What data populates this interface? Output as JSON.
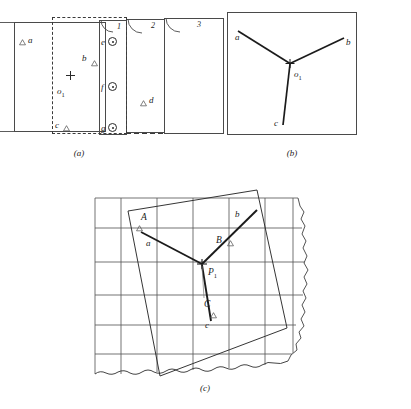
{
  "figure": {
    "domain_note": "photogrammetry figure: overlapping aerial photographs, graphical template, and map fitting",
    "captions": [
      {
        "id": "cap-a",
        "text": "(a)"
      },
      {
        "id": "cap-b",
        "text": "(b)"
      },
      {
        "id": "cap-c",
        "text": "(c)"
      }
    ]
  },
  "panel_a": {
    "caption": "(a)",
    "photo_numbers": [
      "1",
      "2",
      "3"
    ],
    "control_points": [
      {
        "label": "a",
        "marker": "triangle"
      },
      {
        "label": "b",
        "marker": "triangle"
      },
      {
        "label": "c",
        "marker": "triangle"
      },
      {
        "label": "d",
        "marker": "triangle"
      }
    ],
    "pass_points": [
      {
        "label": "e",
        "marker": "circle-dot"
      },
      {
        "label": "f",
        "marker": "circle-dot"
      },
      {
        "label": "g",
        "marker": "circle-dot"
      }
    ],
    "principal_point": {
      "label": "o",
      "subscript": "1",
      "marker": "plus"
    }
  },
  "panel_b": {
    "caption": "(b)",
    "center_label": {
      "label": "o",
      "subscript": "1",
      "marker": "plus"
    },
    "rays": [
      {
        "label": "a",
        "direction": "upper-left"
      },
      {
        "label": "b",
        "direction": "upper-right"
      },
      {
        "label": "c",
        "direction": "lower-left"
      }
    ]
  },
  "panel_c": {
    "caption": "(c)",
    "center_label": {
      "label": "P",
      "subscript": "1",
      "marker": "plus"
    },
    "map_control_points": [
      {
        "upper": "A",
        "lower": "a",
        "marker": "triangle"
      },
      {
        "upper": "B",
        "lower": "b",
        "marker": "triangle"
      },
      {
        "upper": "C",
        "lower": "c",
        "marker": "triangle"
      }
    ],
    "grid": {
      "vertical_lines": 7,
      "horizontal_lines": 6
    },
    "shoreline": "wavy-edge"
  }
}
